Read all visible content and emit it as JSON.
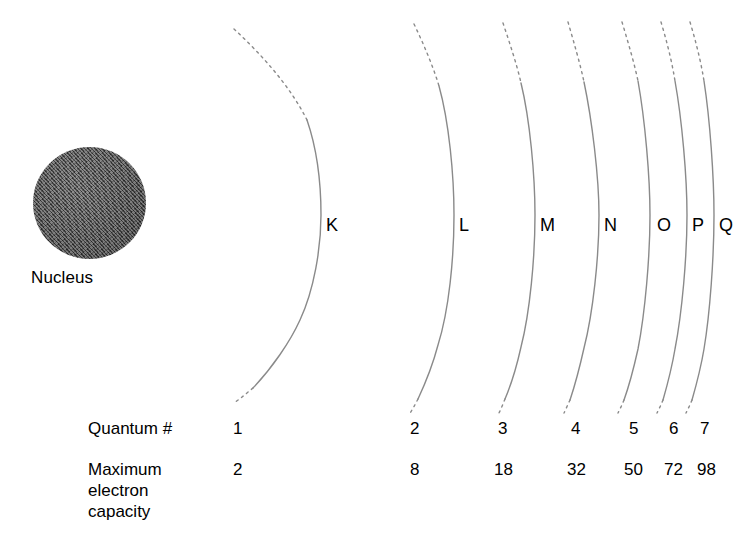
{
  "diagram": {
    "nucleus": {
      "label": "Nucleus",
      "color": "#565656"
    },
    "row_labels": {
      "quantum": "Quantum #",
      "capacity_line1": "Maximum",
      "capacity_line2": "electron",
      "capacity_line3": "capacity"
    },
    "line_color": "#8a8a8a",
    "shells": [
      {
        "letter": "K",
        "quantum_number": "1",
        "max_electrons": "2"
      },
      {
        "letter": "L",
        "quantum_number": "2",
        "max_electrons": "8"
      },
      {
        "letter": "M",
        "quantum_number": "3",
        "max_electrons": "18"
      },
      {
        "letter": "N",
        "quantum_number": "4",
        "max_electrons": "32"
      },
      {
        "letter": "O",
        "quantum_number": "5",
        "max_electrons": "50"
      },
      {
        "letter": "P",
        "quantum_number": "6",
        "max_electrons": "72"
      },
      {
        "letter": "Q",
        "quantum_number": "7",
        "max_electrons": "98"
      }
    ]
  }
}
